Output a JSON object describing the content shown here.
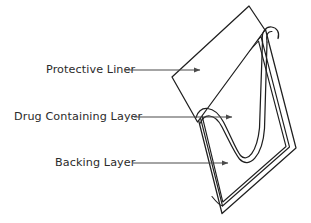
{
  "figure": {
    "background_color": "#ffffff",
    "line_color": "#1f1f1f",
    "leader_color": "#4a4a4a",
    "text_color": "#2b2b2b"
  },
  "labels": [
    {
      "id": "protective-liner",
      "text": "Protective Liner",
      "text_x": 46,
      "text_y": 70,
      "leader_x1": 125,
      "leader_y1": 70,
      "leader_x2": 200,
      "leader_y2": 70
    },
    {
      "id": "drug-containing-layer",
      "text": "Drug Containing Layer",
      "text_x": 14,
      "text_y": 117,
      "leader_x1": 134,
      "leader_y1": 117,
      "leader_x2": 232,
      "leader_y2": 117
    },
    {
      "id": "backing-layer",
      "text": "Backing Layer",
      "text_x": 55,
      "text_y": 163,
      "leader_x1": 133,
      "leader_y1": 163,
      "leader_x2": 228,
      "leader_y2": 163
    }
  ],
  "geometry": {
    "backing_outer": "M 265.5 29.5 L 296.0 148.0 L 222.0 213.5 L 192.5 96.0 Z",
    "backing_inner": "M 261.0 36.5 L 289.5 147.0 L 222.5 206.0 L 196.5 102.0 Z",
    "backing_inner2": "M 258.5 41.0 L 286.0 146.5 L 222.8 202.0 L 199.5 105.0 Z",
    "liner_flap": "M 265.0 30.0 L 249.0 6.0 L 172.0 77.0 L 197.5 122.0 Z",
    "drug_curve_top": "M 196.0 117.5 C 200.0 105.0 214.0 104.5 223.5 122.0 C 231.0 136.5 236.0 150.0 240.5 155.5 C 247.5 163.0 257.0 152.0 259.5 128.0 L 262.5 41.0",
    "drug_curve_bot": "M 200.5 123.0 C 204.0 113.5 214.5 112.5 222.0 127.0 C 229.0 140.5 234.5 153.0 239.5 159.0 C 249.0 169.5 262.5 156.5 264.5 128.5 L 267.0 42.0",
    "fold_top": "M 262.5 41.0 C 261.0 31.0 266.5 26.5 271.5 27.0 C 277.0 27.5 280.0 32.5 278.0 38.5",
    "fold_top2": "M 267.0 42.0 C 265.5 33.5 269.0 31.0 272.0 31.5",
    "inner_corner_left": "M 196.5 102.0 C 194.5 110.0 195.0 114.5 196.0 117.5",
    "inner_corner_bottom": "M 212.0 196.5 C 217.5 203.5 220.5 205.5 222.5 206.0"
  },
  "arrow_head": {
    "size": 4.6
  }
}
